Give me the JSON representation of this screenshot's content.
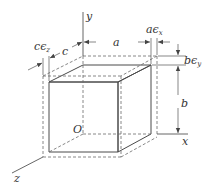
{
  "figure": {
    "type": "strain deformation of rectangular block",
    "axes": {
      "x_label": "x",
      "y_label": "y",
      "z_label": "z",
      "origin_label": "O"
    },
    "dimensions": {
      "a_label": "a",
      "b_label": "b",
      "c_label": "c",
      "a_strain_label": "a",
      "a_strain_eps": "ϵ",
      "a_strain_sub": "x",
      "b_strain_label": "b",
      "b_strain_eps": "ϵ",
      "b_strain_sub": "y",
      "c_strain_label": "c",
      "c_strain_eps": "ϵ",
      "c_strain_sub": "z"
    },
    "colors": {
      "front_face": "#d9d9d9",
      "top_face": "#e6e6e6",
      "side_face": "#c4c4c4",
      "lines": "#4a4a4a",
      "background": "#ffffff"
    }
  }
}
